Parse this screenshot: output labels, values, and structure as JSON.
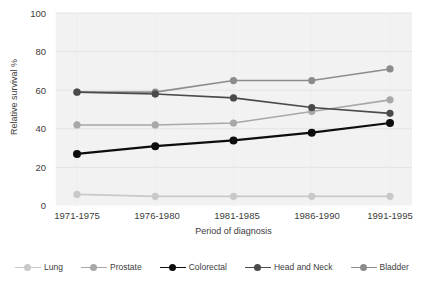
{
  "chart_data": {
    "type": "line",
    "title": "",
    "xlabel": "Period of diagnosis",
    "ylabel": "Relative survival %",
    "categories": [
      "1971-1975",
      "1976-1980",
      "1981-1985",
      "1986-1990",
      "1991-1995"
    ],
    "ylim": [
      0,
      100
    ],
    "yticks": [
      0,
      20,
      40,
      60,
      80,
      100
    ],
    "grid": true,
    "legend_position": "bottom",
    "series": [
      {
        "name": "Lung",
        "values": [
          6,
          5,
          5,
          5,
          5
        ],
        "color": "#c9c9c9"
      },
      {
        "name": "Prostate",
        "values": [
          42,
          42,
          43,
          49,
          55
        ],
        "color": "#a8a8a8"
      },
      {
        "name": "Colorectal",
        "values": [
          27,
          31,
          34,
          38,
          43
        ],
        "color": "#0d0d0d"
      },
      {
        "name": "Head and Neck",
        "values": [
          59,
          58,
          56,
          51,
          48
        ],
        "color": "#4a4a4a"
      },
      {
        "name": "Bladder",
        "values": [
          59,
          59,
          65,
          65,
          71
        ],
        "color": "#8c8c8c"
      }
    ]
  },
  "axes": {
    "y_title": "Relative survival %",
    "x_title": "Period of diagnosis",
    "y_tick_labels": [
      "100",
      "80",
      "60",
      "40",
      "20",
      "0"
    ],
    "x_tick_labels": [
      "1971-1975",
      "1976-1980",
      "1981-1985",
      "1986-1990",
      "1991-1995"
    ]
  },
  "legend": {
    "entries": [
      {
        "label": "Lung"
      },
      {
        "label": "Prostate"
      },
      {
        "label": "Colorectal"
      },
      {
        "label": "Head and Neck"
      },
      {
        "label": "Bladder"
      }
    ]
  }
}
